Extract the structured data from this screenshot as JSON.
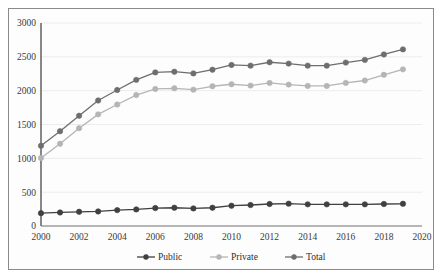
{
  "chart_data": {
    "type": "line",
    "title": "",
    "xlabel": "",
    "ylabel": "",
    "x": [
      2000,
      2001,
      2002,
      2003,
      2004,
      2005,
      2006,
      2007,
      2008,
      2009,
      2010,
      2011,
      2012,
      2013,
      2014,
      2015,
      2016,
      2017,
      2018,
      2019
    ],
    "xlim": [
      2000,
      2020
    ],
    "ylim": [
      0,
      3000
    ],
    "xticks": [
      "2000",
      "2002",
      "2004",
      "2006",
      "2008",
      "2010",
      "2012",
      "2014",
      "2016",
      "2018",
      "2020"
    ],
    "yticks": [
      "0",
      "500",
      "1000",
      "1500",
      "2000",
      "2500",
      "3000"
    ],
    "grid": true,
    "legend_position": "bottom",
    "series": [
      {
        "name": "Public",
        "color": "#404040",
        "values": [
          190,
          200,
          210,
          215,
          235,
          245,
          265,
          270,
          260,
          270,
          300,
          310,
          325,
          330,
          320,
          320,
          320,
          320,
          325,
          328
        ]
      },
      {
        "name": "Private",
        "color": "#b5b5b5",
        "values": [
          1005,
          1215,
          1445,
          1650,
          1795,
          1935,
          2025,
          2035,
          2015,
          2065,
          2095,
          2075,
          2115,
          2090,
          2070,
          2070,
          2115,
          2150,
          2235,
          2315
        ]
      },
      {
        "name": "Total",
        "color": "#6e6e6e",
        "values": [
          1185,
          1400,
          1630,
          1855,
          2010,
          2160,
          2270,
          2280,
          2255,
          2310,
          2380,
          2370,
          2420,
          2400,
          2370,
          2370,
          2415,
          2455,
          2535,
          2610
        ]
      }
    ]
  },
  "legend": {
    "items": [
      {
        "label": "Public",
        "color": "#404040"
      },
      {
        "label": "Private",
        "color": "#b5b5b5"
      },
      {
        "label": "Total",
        "color": "#6e6e6e"
      }
    ]
  }
}
